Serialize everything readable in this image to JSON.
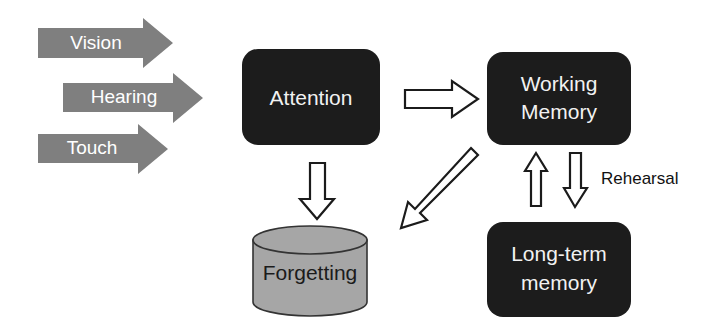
{
  "diagram": {
    "colors": {
      "background": "#ffffff",
      "dark_box_fill": "#1c1c1c",
      "dark_box_text": "#f2f2f2",
      "sense_arrow_fill": "#7f7f7f",
      "sense_arrow_text": "#ffffff",
      "cylinder_fill": "#a6a6a6",
      "cylinder_stroke": "#333333",
      "cylinder_text": "#1b1b1b",
      "outline_arrow_fill": "#ffffff",
      "outline_arrow_stroke": "#1b1b1b",
      "edge_label_text": "#111111"
    },
    "sense_arrows": [
      {
        "id": "vision",
        "label": "Vision"
      },
      {
        "id": "hearing",
        "label": "Hearing"
      },
      {
        "id": "touch",
        "label": "Touch"
      }
    ],
    "nodes": [
      {
        "id": "attention",
        "label": "Attention",
        "shape": "rounded-rect",
        "style": "dark"
      },
      {
        "id": "working-memory",
        "label_line1": "Working",
        "label_line2": "Memory",
        "shape": "rounded-rect",
        "style": "dark"
      },
      {
        "id": "long-term-memory",
        "label_line1": "Long-term",
        "label_line2": "memory",
        "shape": "rounded-rect",
        "style": "dark"
      },
      {
        "id": "forgetting",
        "label": "Forgetting",
        "shape": "cylinder",
        "style": "gray"
      }
    ],
    "edges": [
      {
        "id": "attention-to-working-memory",
        "from": "attention",
        "to": "working-memory",
        "direction": "right",
        "label": ""
      },
      {
        "id": "attention-to-forgetting",
        "from": "attention",
        "to": "forgetting",
        "direction": "down",
        "label": ""
      },
      {
        "id": "working-memory-to-forgetting",
        "from": "working-memory",
        "to": "forgetting",
        "direction": "diagonal-down-left",
        "label": ""
      },
      {
        "id": "long-term-memory-to-working-memory",
        "from": "long-term-memory",
        "to": "working-memory",
        "direction": "up",
        "label": ""
      },
      {
        "id": "working-memory-to-long-term-memory",
        "from": "working-memory",
        "to": "long-term-memory",
        "direction": "down",
        "label": "Rehearsal"
      }
    ],
    "edge_labels": [
      {
        "id": "rehearsal",
        "text": "Rehearsal"
      }
    ]
  }
}
